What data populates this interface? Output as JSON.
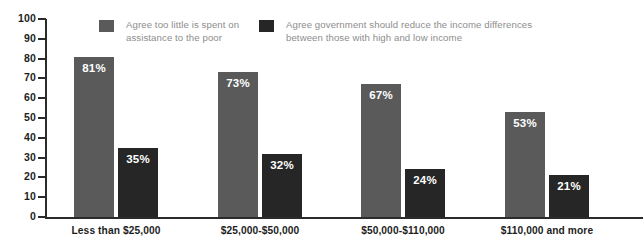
{
  "chart_data": {
    "type": "bar",
    "title": "",
    "subtitle": "",
    "xlabel": "",
    "ylabel": "",
    "ylim": [
      0,
      100
    ],
    "yticks": [
      "0",
      "10",
      "20",
      "30",
      "40",
      "50",
      "60",
      "70",
      "80",
      "90",
      "100"
    ],
    "grid": false,
    "legend_position": "top",
    "categories": [
      "Less than $25,000",
      "$25,000-$50,000",
      "$50,000-$110,000",
      "$110,000 and more"
    ],
    "series": [
      {
        "name": "Agree too little is spent on assistance to the poor",
        "color": "#5a5a5a",
        "values": [
          81,
          73,
          67,
          53
        ],
        "labels": [
          "81%",
          "73%",
          "67%",
          "53%"
        ]
      },
      {
        "name": "Agree government should reduce the income differences between those with high and low income",
        "color": "#262626",
        "values": [
          35,
          32,
          24,
          21
        ],
        "labels": [
          "35%",
          "32%",
          "24%",
          "21%"
        ]
      }
    ]
  },
  "legend": {
    "entries": [
      {
        "label": "Agree too little is spent on\nassistance to the poor",
        "swatch_color": "#5a5a5a",
        "swatch_name": "legend-swatch-primary"
      },
      {
        "label": "Agree government should reduce the income differences\nbetween those with high and low income",
        "swatch_color": "#262626",
        "swatch_name": "legend-swatch-secondary"
      }
    ]
  },
  "axis": {
    "y_labels": [
      "100",
      "90",
      "80",
      "70",
      "60",
      "50",
      "40",
      "30",
      "20",
      "10",
      "0"
    ]
  },
  "colors": {
    "primary_bar": "#5a5a5a",
    "secondary_bar": "#262626",
    "axis": "#2b2b2b",
    "legend_text": "#8d8d8d",
    "category_text": "#1d1d1d",
    "background": "#ffffff"
  }
}
